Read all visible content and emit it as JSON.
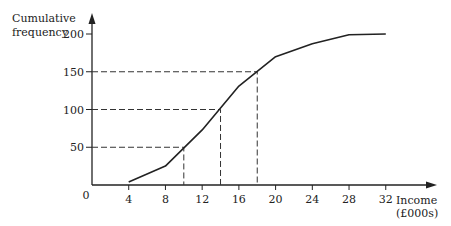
{
  "chart_data": {
    "type": "line",
    "title": "",
    "xlabel": "Income (£000s)",
    "ylabel": "Cumulative frequency",
    "x": [
      4,
      8,
      12,
      16,
      20,
      24,
      28,
      32
    ],
    "series": [
      {
        "name": "Cumulative frequency",
        "values": [
          4,
          25,
          73,
          131,
          170,
          187,
          199,
          200
        ]
      }
    ],
    "x_ticks": [
      4,
      8,
      12,
      16,
      20,
      24,
      28,
      32
    ],
    "y_ticks": [
      50,
      100,
      150,
      200
    ],
    "origin_label": "0",
    "xlim": [
      0,
      34
    ],
    "ylim": [
      0,
      210
    ],
    "grid": false,
    "annotations": [
      {
        "type": "dashed-guide",
        "y": 50,
        "x": 10
      },
      {
        "type": "dashed-guide",
        "y": 100,
        "x": 14
      },
      {
        "type": "dashed-guide",
        "y": 150,
        "x": 18
      }
    ]
  },
  "labels": {
    "ylabel_line1": "Cumulative",
    "ylabel_line2": "frequency",
    "xlabel_line1": "Income",
    "xlabel_line2": "(£000s)",
    "origin": "0",
    "xticks": [
      "4",
      "8",
      "12",
      "16",
      "20",
      "24",
      "28",
      "32"
    ],
    "yticks": [
      "50",
      "100",
      "150",
      "200"
    ]
  }
}
